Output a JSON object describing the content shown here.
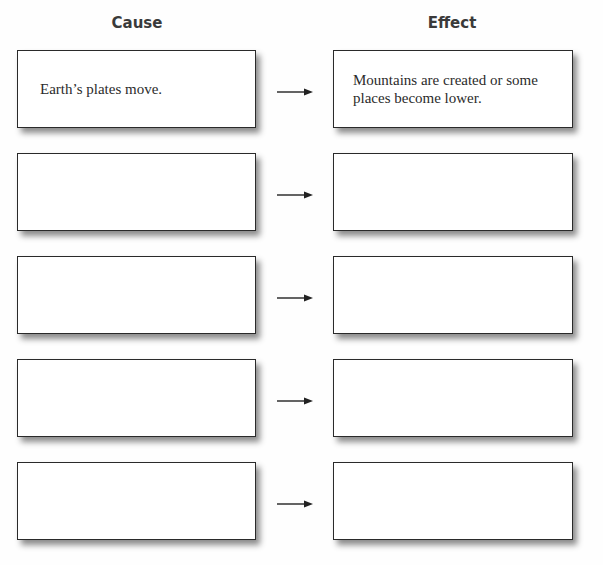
{
  "headings": {
    "cause": "Cause",
    "effect": "Effect"
  },
  "rows": [
    {
      "cause": "Earth’s plates move.",
      "effect": "Mountains are created or some places become lower."
    },
    {
      "cause": "",
      "effect": ""
    },
    {
      "cause": "",
      "effect": ""
    },
    {
      "cause": "",
      "effect": ""
    },
    {
      "cause": "",
      "effect": ""
    }
  ],
  "icons": {
    "arrow": "right-arrow"
  },
  "colors": {
    "border": "#2a2a2a",
    "heading": "#3a3a3a",
    "text": "#2b2b2b"
  }
}
